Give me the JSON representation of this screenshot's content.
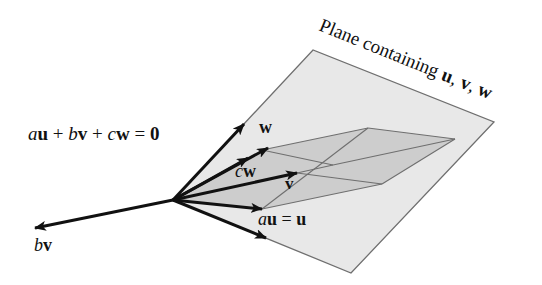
{
  "diagram": {
    "type": "vector-plane",
    "plane_label": {
      "prefix": "Plane containing ",
      "vectors": [
        "u",
        "v",
        "w"
      ],
      "separator": ", "
    },
    "equation": {
      "terms": [
        {
          "coef": "a",
          "vec": "u"
        },
        {
          "coef": "b",
          "vec": "v"
        },
        {
          "coef": "c",
          "vec": "w"
        }
      ],
      "plus": "+",
      "equals": "=",
      "rhs": "0"
    },
    "labels": {
      "w": "w",
      "cw_coef": "c",
      "cw_vec": "w",
      "v": "v",
      "au_coef": "a",
      "au_vec": "u",
      "au_eq": "=",
      "au_rhs": "u",
      "bv_coef": "b",
      "bv_vec": "v"
    },
    "colors": {
      "plane_fill": "#e8e8e8",
      "parallelogram_fill": "#cdcdcd",
      "edge": "#6f6f6f",
      "arrow": "#111111"
    }
  }
}
